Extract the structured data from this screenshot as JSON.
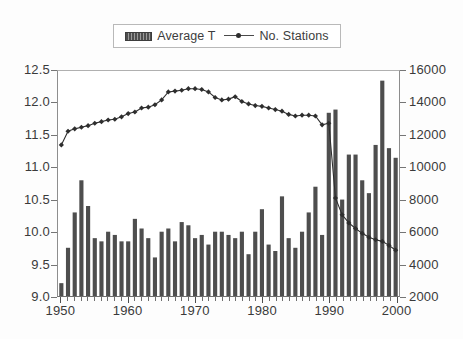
{
  "chart_data": {
    "type": "bar",
    "title": "",
    "subtitle": "",
    "xlabel": "",
    "ylabel": "",
    "y2label": "",
    "grid": false,
    "legend_position": "top-center",
    "x": [
      1950,
      1951,
      1952,
      1953,
      1954,
      1955,
      1956,
      1957,
      1958,
      1959,
      1960,
      1961,
      1962,
      1963,
      1964,
      1965,
      1966,
      1967,
      1968,
      1969,
      1970,
      1971,
      1972,
      1973,
      1974,
      1975,
      1976,
      1977,
      1978,
      1979,
      1980,
      1981,
      1982,
      1983,
      1984,
      1985,
      1986,
      1987,
      1988,
      1989,
      1990,
      1991,
      1992,
      1993,
      1994,
      1995,
      1996,
      1997,
      1998,
      1999,
      2000
    ],
    "xlim": [
      1949.5,
      2000.5
    ],
    "xticks": [
      1950,
      1960,
      1970,
      1980,
      1990,
      2000
    ],
    "xticklabels": [
      "1950",
      "1960",
      "1970",
      "1980",
      "1990",
      "2000"
    ],
    "ylim": [
      9.0,
      12.5
    ],
    "yticks": [
      9.0,
      9.5,
      10.0,
      10.5,
      11.0,
      11.5,
      12.0,
      12.5
    ],
    "yticklabels": [
      "9.0",
      "9.5",
      "10.0",
      "10.5",
      "11.0",
      "11.5",
      "12.0",
      "12.5"
    ],
    "y2lim": [
      2000,
      16000
    ],
    "y2ticks": [
      2000,
      4000,
      6000,
      8000,
      10000,
      12000,
      14000,
      16000
    ],
    "y2ticklabels": [
      "2000",
      "4000",
      "6000",
      "8000",
      "10000",
      "12000",
      "14000",
      "16000"
    ],
    "series": [
      {
        "name": "Average T",
        "type": "bar",
        "axis": "left",
        "color": "#4e4e4e",
        "values": [
          9.2,
          9.75,
          10.3,
          10.8,
          10.4,
          9.9,
          9.85,
          10.0,
          9.95,
          9.85,
          9.85,
          10.2,
          10.05,
          9.9,
          9.6,
          10.0,
          10.05,
          9.85,
          10.15,
          10.1,
          9.9,
          9.95,
          9.8,
          10.0,
          10.0,
          9.95,
          9.9,
          10.0,
          9.65,
          10.0,
          10.35,
          9.8,
          9.7,
          10.55,
          9.9,
          9.75,
          10.0,
          10.3,
          10.7,
          9.95,
          11.85,
          11.9,
          10.5,
          11.2,
          11.2,
          10.8,
          10.6,
          11.35,
          12.35,
          11.3,
          11.15
        ]
      },
      {
        "name": "No. Stations",
        "type": "line",
        "axis": "right",
        "color": "#2e2e2e",
        "marker": "diamond",
        "values": [
          11400,
          12250,
          12400,
          12500,
          12600,
          12750,
          12850,
          12950,
          13000,
          13150,
          13350,
          13450,
          13700,
          13750,
          13900,
          14200,
          14700,
          14750,
          14800,
          14900,
          14900,
          14850,
          14700,
          14350,
          14200,
          14250,
          14400,
          14100,
          13950,
          13850,
          13800,
          13700,
          13600,
          13500,
          13300,
          13200,
          13250,
          13250,
          13200,
          12650,
          12750,
          8100,
          7050,
          6550,
          6200,
          5900,
          5650,
          5500,
          5400,
          5150,
          4850
        ]
      }
    ]
  },
  "legend": {
    "entries": [
      {
        "label": "Average T",
        "marker": "bar-swatch"
      },
      {
        "label": "No. Stations",
        "marker": "line-diamond-swatch"
      }
    ]
  }
}
